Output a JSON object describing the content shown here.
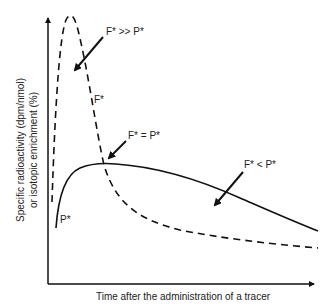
{
  "diagram": {
    "type": "schematic-curves",
    "x_axis_label": "Time after the administration of a tracer",
    "y_axis_label_line1": "Specific radioactivity (dpm/nmol)",
    "y_axis_label_line2": "or isotopic enrichment (%)",
    "curves": [
      {
        "name": "F*",
        "style": "dashed",
        "label": "F*"
      },
      {
        "name": "P*",
        "style": "solid",
        "label": "P*"
      }
    ],
    "annotations": {
      "f_much_greater_p": "F* >> P*",
      "f_equal_p": "F* = P*",
      "f_less_p": "F* < P*"
    },
    "colors": {
      "line": "#111111",
      "text": "#222222",
      "background": "#ffffff"
    }
  }
}
